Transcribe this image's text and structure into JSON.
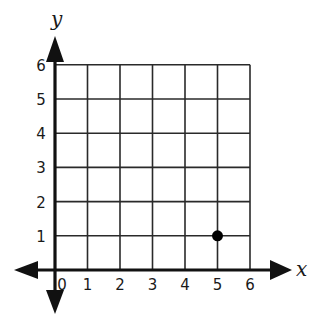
{
  "chart_data": {
    "type": "scatter",
    "title": "",
    "xlabel": "x",
    "ylabel": "y",
    "xlim": [
      0,
      6
    ],
    "ylim": [
      0,
      6
    ],
    "grid": true,
    "x_ticks": [
      "0",
      "1",
      "2",
      "3",
      "4",
      "5",
      "6"
    ],
    "y_ticks": [
      "1",
      "2",
      "3",
      "4",
      "5",
      "6"
    ],
    "series": [
      {
        "name": "point",
        "points": [
          {
            "x": 5,
            "y": 1
          }
        ]
      }
    ],
    "colors": {
      "grid": "#2a2a2a",
      "axis": "#111111",
      "point": "#000000"
    }
  }
}
